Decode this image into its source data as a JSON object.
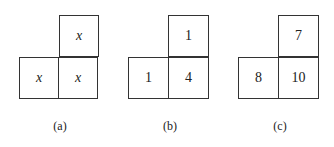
{
  "panels": [
    {
      "label": "(a)",
      "top": "x",
      "bottom_left": "x",
      "bottom_right": "x",
      "italic": true
    },
    {
      "label": "(b)",
      "top": "1",
      "bottom_left": "1",
      "bottom_right": "4",
      "italic": false
    },
    {
      "label": "(c)",
      "top": "7",
      "bottom_left": "8",
      "bottom_right": "10",
      "italic": false
    }
  ]
}
